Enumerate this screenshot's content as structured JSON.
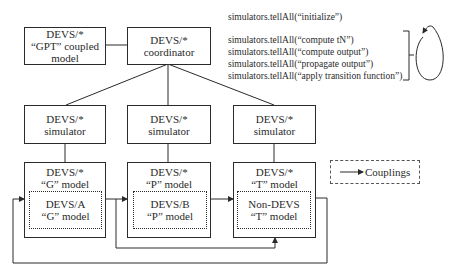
{
  "top": {
    "gpt_model": {
      "line1": "DEVS/*",
      "line2": "“GPT” coupled",
      "line3": "model"
    },
    "coordinator": {
      "line1": "DEVS/*",
      "line2": "coordinator"
    }
  },
  "simulators": [
    {
      "line1": "DEVS/*",
      "line2": "simulator"
    },
    {
      "line1": "DEVS/*",
      "line2": "simulator"
    },
    {
      "line1": "DEVS/*",
      "line2": "simulator"
    }
  ],
  "models": [
    {
      "line1": "DEVS/*",
      "line2": "“G” model",
      "inner1": "DEVS/A",
      "inner2": "“G” model"
    },
    {
      "line1": "DEVS/*",
      "line2": "“P” model",
      "inner1": "DEVS/B",
      "inner2": "“P” model"
    },
    {
      "line1": "DEVS/*",
      "line2": "“T” model",
      "inner1": "Non-DEVS",
      "inner2": "“T” model"
    }
  ],
  "commands": {
    "init": "simulators.tellAll(“initialize”)",
    "loop": [
      "simulators.tellAll(“compute tN”)",
      "simulators.tellAll(“compute output”)",
      "simulators.tellAll(“propagate output”)",
      "simulators.tellAll(“apply transition function”)"
    ]
  },
  "legend": {
    "label": "Couplings",
    "icon": "arrow-right-icon"
  },
  "colors": {
    "stroke": "#2a2a2a",
    "background": "#ffffff"
  }
}
